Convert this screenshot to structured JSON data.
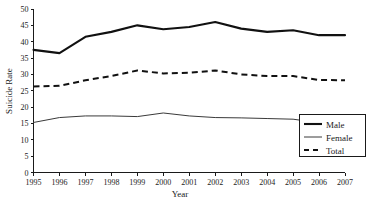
{
  "chart_data": {
    "type": "line",
    "title": "",
    "xlabel": "Year",
    "ylabel": "Suicide Rate",
    "categories": [
      1995,
      1996,
      1997,
      1998,
      1999,
      2000,
      2001,
      2002,
      2003,
      2004,
      2005,
      2006,
      2007
    ],
    "x_tick_labels": [
      "1995",
      "1996",
      "1997",
      "1998",
      "1999",
      "2000",
      "2001",
      "2002",
      "2003",
      "2004",
      "2005",
      "2006",
      "2007"
    ],
    "y_tick_labels": [
      "0",
      "5",
      "10",
      "15",
      "20",
      "25",
      "30",
      "35",
      "40",
      "45",
      "50"
    ],
    "y_ticks": [
      0,
      5,
      10,
      15,
      20,
      25,
      30,
      35,
      40,
      45,
      50
    ],
    "xlim": [
      1995,
      2007
    ],
    "ylim": [
      0,
      50
    ],
    "grid": false,
    "legend_position": "bottom-right",
    "series": [
      {
        "name": "Male",
        "style": "solid-thick",
        "color": "#111111",
        "values": [
          37.5,
          36.5,
          41.5,
          43.0,
          45.0,
          43.8,
          44.5,
          46.0,
          44.0,
          43.0,
          43.5,
          42.0,
          42.0
        ]
      },
      {
        "name": "Female",
        "style": "solid-thin",
        "color": "#3a3a3a",
        "values": [
          15.3,
          16.8,
          17.3,
          17.3,
          17.1,
          18.2,
          17.3,
          16.8,
          16.7,
          16.5,
          16.3,
          15.2,
          15.0
        ]
      },
      {
        "name": "Total",
        "style": "dashed",
        "color": "#111111",
        "values": [
          26.3,
          26.5,
          28.2,
          29.5,
          31.2,
          30.3,
          30.5,
          31.2,
          30.0,
          29.5,
          29.5,
          28.3,
          28.2
        ]
      }
    ]
  },
  "legend": {
    "items": [
      {
        "label": "Male"
      },
      {
        "label": "Female"
      },
      {
        "label": "Total"
      }
    ]
  }
}
